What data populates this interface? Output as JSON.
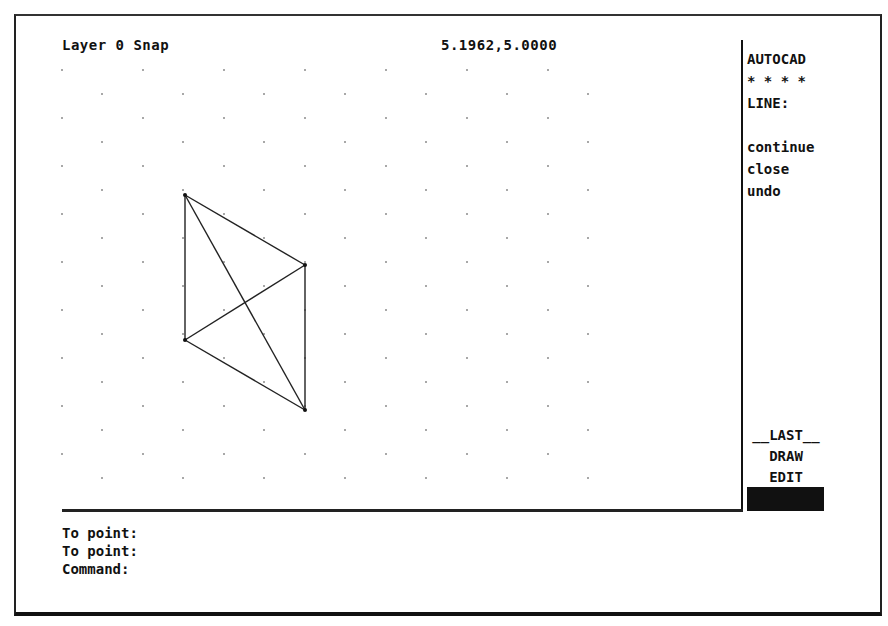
{
  "status_bar": {
    "layer_snap": "Layer 0 Snap",
    "coordinates": "5.1962,5.0000"
  },
  "side_menu": {
    "header": "AUTOCAD",
    "stars": "* * * *",
    "command": "LINE:",
    "options": [
      "continue",
      "close",
      "undo"
    ],
    "bottom_items": [
      "__LAST__",
      "DRAW",
      "EDIT"
    ]
  },
  "command_area": {
    "lines": [
      "To point:",
      "To point:",
      "Command:"
    ]
  },
  "drawing": {
    "grid": {
      "row_a_x": [
        62,
        143,
        224,
        305,
        386,
        467,
        548
      ],
      "row_b_x": [
        102,
        183,
        264,
        345,
        426,
        507,
        588
      ],
      "row_a_y": [
        70,
        118,
        166,
        214,
        262,
        310,
        358,
        406,
        454
      ],
      "row_b_y": [
        94,
        142,
        190,
        238,
        286,
        334,
        382,
        430,
        478
      ]
    },
    "vertices": [
      [
        185,
        195
      ],
      [
        305,
        265
      ],
      [
        185,
        340
      ],
      [
        305,
        410
      ]
    ],
    "segments": [
      [
        0,
        2
      ],
      [
        0,
        1
      ],
      [
        0,
        3
      ],
      [
        1,
        3
      ],
      [
        1,
        2
      ],
      [
        2,
        3
      ]
    ],
    "line_color": "#222222"
  },
  "colors": {
    "background": "#ffffff",
    "foreground": "#111111"
  }
}
